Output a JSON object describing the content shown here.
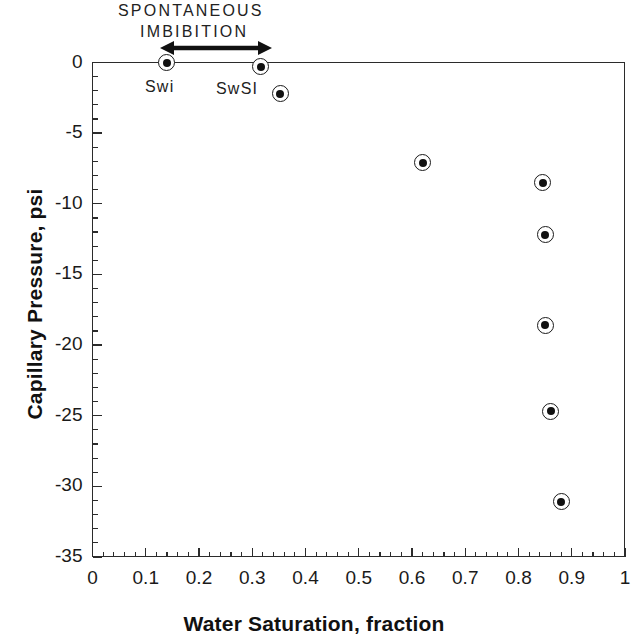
{
  "chart_data": {
    "type": "scatter",
    "title": "",
    "xlabel": "Water Saturation, fraction",
    "ylabel": "Capillary Pressure, psi",
    "xlim": [
      0,
      1
    ],
    "ylim": [
      -35,
      0
    ],
    "grid": false,
    "legend": null,
    "x_ticks": [
      "0",
      "0.1",
      "0.2",
      "0.3",
      "0.4",
      "0.5",
      "0.6",
      "0.7",
      "0.8",
      "0.9",
      "1"
    ],
    "x_tick_values": [
      0,
      0.1,
      0.2,
      0.3,
      0.4,
      0.5,
      0.6,
      0.7,
      0.8,
      0.9,
      1
    ],
    "x_minor_interval": 0.02,
    "y_ticks": [
      "0",
      "-5",
      "-10",
      "-15",
      "-20",
      "-25",
      "-30",
      "-35"
    ],
    "y_tick_values": [
      0,
      -5,
      -10,
      -15,
      -20,
      -25,
      -30,
      -35
    ],
    "y_minor_interval": 1,
    "marker_style": "bullseye-open-circle-with-filled-center",
    "series": [
      {
        "name": "Capillary pressure data",
        "points": [
          {
            "x": 0.139,
            "y": 0.0
          },
          {
            "x": 0.316,
            "y": -0.3
          },
          {
            "x": 0.353,
            "y": -2.2
          },
          {
            "x": 0.62,
            "y": -7.1
          },
          {
            "x": 0.846,
            "y": -8.5
          },
          {
            "x": 0.85,
            "y": -12.2
          },
          {
            "x": 0.85,
            "y": -18.6
          },
          {
            "x": 0.861,
            "y": -24.7
          },
          {
            "x": 0.88,
            "y": -31.1
          }
        ]
      }
    ],
    "annotations": {
      "region_title_line1": "SPONTANEOUS",
      "region_title_line2": "IMBIBITION",
      "arrow": {
        "type": "double-headed-horizontal-arrow",
        "x_start": 0.139,
        "x_end": 0.316,
        "y": 0.6
      },
      "point_labels": [
        {
          "text": "Swi",
          "x": 0.139,
          "y": 0.0
        },
        {
          "text": "SwSI",
          "x": 0.316,
          "y": -0.3
        }
      ]
    },
    "colors": {
      "axis": "#2b2b2b",
      "marker_edge": "#1a1a1a",
      "marker_fill": "#111111",
      "background": "#ffffff",
      "text": "#1a1a1a"
    }
  }
}
